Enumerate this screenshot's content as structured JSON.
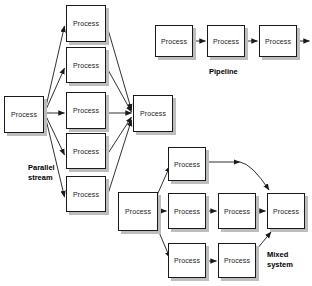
{
  "canvas": {
    "width": 312,
    "height": 286,
    "background": "#ffffff"
  },
  "style": {
    "node_fill": "#ffffff",
    "node_stroke": "#1a1a1a",
    "node_shadow": "#bdbdbd",
    "edge_color": "#1a1a1a",
    "label_color": "#000000"
  },
  "diagram": {
    "type": "flow-diagram",
    "groups": [
      {
        "id": "parallel-stream",
        "label": "Parallel\nstream",
        "label_x": 28,
        "label_y": 163,
        "nodes": [
          {
            "id": "ps-src",
            "label": "Process",
            "x": 4,
            "y": 96,
            "w": 40,
            "h": 37
          },
          {
            "id": "ps-b1",
            "label": "Process",
            "x": 66,
            "y": 5,
            "w": 40,
            "h": 37
          },
          {
            "id": "ps-b2",
            "label": "Process",
            "x": 66,
            "y": 47,
            "w": 40,
            "h": 36
          },
          {
            "id": "ps-b3",
            "label": "Process",
            "x": 66,
            "y": 92,
            "w": 40,
            "h": 37
          },
          {
            "id": "ps-b4",
            "label": "Process",
            "x": 66,
            "y": 133,
            "w": 40,
            "h": 36
          },
          {
            "id": "ps-b5",
            "label": "Process",
            "x": 66,
            "y": 176,
            "w": 40,
            "h": 36
          },
          {
            "id": "ps-sink",
            "label": "Process",
            "x": 133,
            "y": 95,
            "w": 40,
            "h": 37
          }
        ]
      },
      {
        "id": "pipeline",
        "label": "Pipeline",
        "label_x": 209,
        "label_y": 67,
        "nodes": [
          {
            "id": "pl-1",
            "label": "Process",
            "x": 155,
            "y": 25,
            "w": 38,
            "h": 32
          },
          {
            "id": "pl-2",
            "label": "Process",
            "x": 207,
            "y": 25,
            "w": 38,
            "h": 32
          },
          {
            "id": "pl-3",
            "label": "Process",
            "x": 259,
            "y": 25,
            "w": 38,
            "h": 32
          }
        ]
      },
      {
        "id": "mixed-system",
        "label": "Mixed\nsystem",
        "label_x": 267,
        "label_y": 250,
        "nodes": [
          {
            "id": "mx-src",
            "label": "Process",
            "x": 118,
            "y": 192,
            "w": 40,
            "h": 39
          },
          {
            "id": "mx-top",
            "label": "Process",
            "x": 168,
            "y": 147,
            "w": 38,
            "h": 34
          },
          {
            "id": "mx-mid1",
            "label": "Process",
            "x": 168,
            "y": 193,
            "w": 38,
            "h": 36
          },
          {
            "id": "mx-bot1",
            "label": "Process",
            "x": 168,
            "y": 243,
            "w": 38,
            "h": 35
          },
          {
            "id": "mx-mid2",
            "label": "Process",
            "x": 218,
            "y": 193,
            "w": 38,
            "h": 36
          },
          {
            "id": "mx-bot2",
            "label": "Process",
            "x": 218,
            "y": 243,
            "w": 38,
            "h": 35
          },
          {
            "id": "mx-sink",
            "label": "Process",
            "x": 267,
            "y": 193,
            "w": 38,
            "h": 36
          }
        ]
      }
    ],
    "edges": [
      {
        "id": "ps-src-to-b1",
        "from": "ps-src",
        "to": "ps-b1",
        "kind": "diagonal-up"
      },
      {
        "id": "ps-src-to-b2",
        "from": "ps-src",
        "to": "ps-b2",
        "kind": "diagonal-up"
      },
      {
        "id": "ps-src-to-b3",
        "from": "ps-src",
        "to": "ps-b3",
        "kind": "straight"
      },
      {
        "id": "ps-src-to-b4",
        "from": "ps-src",
        "to": "ps-b4",
        "kind": "diagonal-down"
      },
      {
        "id": "ps-src-to-b5",
        "from": "ps-src",
        "to": "ps-b5",
        "kind": "diagonal-down"
      },
      {
        "id": "ps-b1-to-sink",
        "from": "ps-b1",
        "to": "ps-sink",
        "kind": "diagonal-down"
      },
      {
        "id": "ps-b2-to-sink",
        "from": "ps-b2",
        "to": "ps-sink",
        "kind": "diagonal-down"
      },
      {
        "id": "ps-b3-to-sink",
        "from": "ps-b3",
        "to": "ps-sink",
        "kind": "straight"
      },
      {
        "id": "ps-b4-to-sink",
        "from": "ps-b4",
        "to": "ps-sink",
        "kind": "diagonal-up"
      },
      {
        "id": "ps-b5-to-sink",
        "from": "ps-b5",
        "to": "ps-sink",
        "kind": "diagonal-up"
      },
      {
        "id": "pl-1-to-2",
        "from": "pl-1",
        "to": "pl-2",
        "kind": "straight"
      },
      {
        "id": "pl-2-to-3",
        "from": "pl-2",
        "to": "pl-3",
        "kind": "straight"
      },
      {
        "id": "pl-3-out",
        "from": "pl-3",
        "to": null,
        "kind": "exit-right"
      },
      {
        "id": "mx-src-to-top",
        "from": "mx-src",
        "to": "mx-top",
        "kind": "diagonal-up"
      },
      {
        "id": "mx-src-to-mid1",
        "from": "mx-src",
        "to": "mx-mid1",
        "kind": "straight"
      },
      {
        "id": "mx-src-to-bot1",
        "from": "mx-src",
        "to": "mx-bot1",
        "kind": "diagonal-down"
      },
      {
        "id": "mx-top-to-sink",
        "from": "mx-top",
        "to": "mx-sink",
        "kind": "elbow"
      },
      {
        "id": "mx-mid1-to-mid2",
        "from": "mx-mid1",
        "to": "mx-mid2",
        "kind": "straight"
      },
      {
        "id": "mx-mid2-to-sink",
        "from": "mx-mid2",
        "to": "mx-sink",
        "kind": "straight"
      },
      {
        "id": "mx-bot1-to-bot2",
        "from": "mx-bot1",
        "to": "mx-bot2",
        "kind": "straight"
      },
      {
        "id": "mx-bot2-to-sink",
        "from": "mx-bot2",
        "to": "mx-sink",
        "kind": "diagonal-up"
      }
    ]
  }
}
